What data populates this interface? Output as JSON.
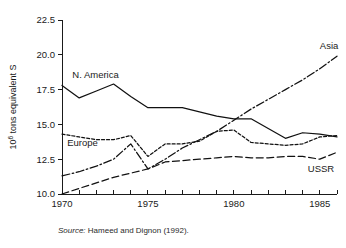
{
  "figure": {
    "source_prefix": "Source:",
    "source_text": "Hameed and Dignon (1992)."
  },
  "chart_data": {
    "type": "line",
    "title": "",
    "xlabel": "",
    "ylabel": "10⁶ tons equivalent S",
    "ylabel_mantissa": "10",
    "ylabel_exponent": "6",
    "ylabel_rest": " tons equivalent S",
    "xlim": [
      1970,
      1986
    ],
    "ylim": [
      10.0,
      22.5
    ],
    "grid": false,
    "legend_position": "inline-annotations",
    "x_tick_labels": [
      "1970",
      "1975",
      "1980",
      "1985"
    ],
    "x_tick_values": [
      1970,
      1975,
      1980,
      1985
    ],
    "x_minor_ticks": [
      1971,
      1972,
      1973,
      1974,
      1976,
      1977,
      1978,
      1979,
      1981,
      1982,
      1983,
      1984,
      1986
    ],
    "y_tick_labels": [
      "10.0",
      "12.5",
      "15.0",
      "17.5",
      "20.0",
      "22.5"
    ],
    "y_tick_values": [
      10.0,
      12.5,
      15.0,
      17.5,
      20.0,
      22.5
    ],
    "x": [
      1970,
      1971,
      1972,
      1973,
      1974,
      1975,
      1976,
      1977,
      1978,
      1979,
      1980,
      1981,
      1982,
      1983,
      1984,
      1985,
      1986
    ],
    "series": [
      {
        "name": "N. America",
        "label": "N. America",
        "dash": "solid",
        "label_x": 1970.6,
        "label_y": 18.35,
        "values": [
          17.8,
          16.9,
          17.4,
          17.9,
          17.0,
          16.2,
          16.2,
          16.2,
          15.9,
          15.6,
          15.4,
          15.4,
          14.7,
          14.0,
          14.4,
          14.3,
          14.1
        ]
      },
      {
        "name": "Europe",
        "label": "Europe",
        "dash": "dotted",
        "label_x": 1970.3,
        "label_y": 13.45,
        "values": [
          14.3,
          14.1,
          13.9,
          13.9,
          14.2,
          12.7,
          13.6,
          13.6,
          13.8,
          14.5,
          14.6,
          13.7,
          13.6,
          13.5,
          13.6,
          14.1,
          14.2
        ]
      },
      {
        "name": "Asia",
        "label": "Asia",
        "dash": "dashdot",
        "label_x": 1985.0,
        "label_y": 20.45,
        "values": [
          11.3,
          11.6,
          12.0,
          12.5,
          13.6,
          11.8,
          12.5,
          13.3,
          13.9,
          14.5,
          15.3,
          16.1,
          16.8,
          17.5,
          18.2,
          19.0,
          19.9
        ]
      },
      {
        "name": "USSR",
        "label": "USSR",
        "dash": "dashed",
        "label_x": 1984.3,
        "label_y": 11.6,
        "values": [
          10.0,
          10.4,
          10.8,
          11.2,
          11.5,
          11.8,
          12.3,
          12.4,
          12.5,
          12.6,
          12.7,
          12.6,
          12.6,
          12.7,
          12.7,
          12.5,
          13.0
        ]
      }
    ]
  }
}
